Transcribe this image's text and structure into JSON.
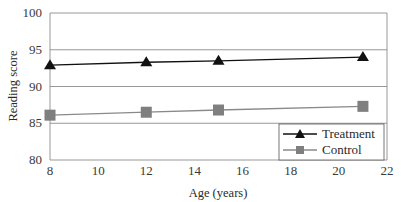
{
  "chart_data": {
    "type": "line",
    "title": "",
    "xlabel": "Age (years)",
    "ylabel": "Reading score",
    "xlim": [
      8,
      22
    ],
    "ylim": [
      80,
      100
    ],
    "x_ticks": [
      8,
      10,
      12,
      14,
      16,
      18,
      20,
      22
    ],
    "y_ticks": [
      80,
      85,
      90,
      95,
      100
    ],
    "grid": "horizontal",
    "legend_position": "lower right",
    "x": [
      8,
      12,
      15,
      21
    ],
    "series": [
      {
        "name": "Treatment",
        "marker": "triangle",
        "color": "#111111",
        "values": [
          92.9,
          93.3,
          93.5,
          94.0
        ]
      },
      {
        "name": "Control",
        "marker": "square",
        "color": "#808080",
        "values": [
          86.1,
          86.5,
          86.8,
          87.3
        ]
      }
    ]
  },
  "colors": {
    "grid": "#8c8c8c",
    "axis": "#8c8c8c",
    "treatment_line": "#111111",
    "control_line": "#8a8a8a",
    "control_marker": "#7f7f7f"
  }
}
